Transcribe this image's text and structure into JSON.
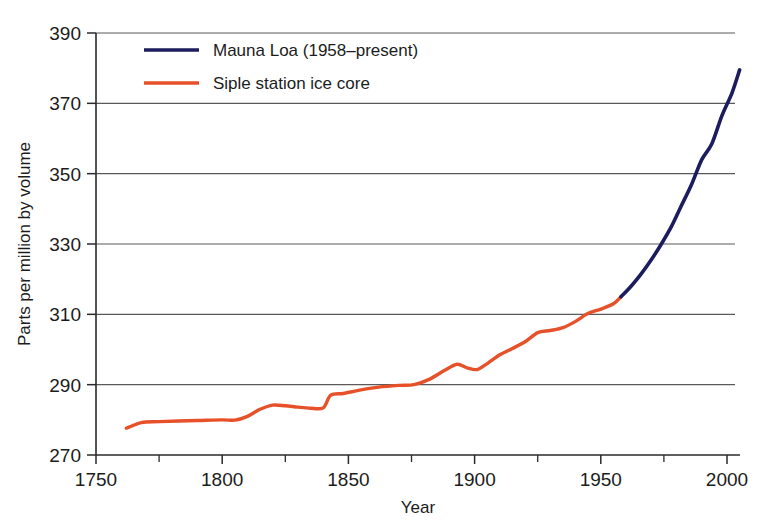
{
  "chart_data": {
    "type": "line",
    "title": "",
    "xlabel": "Year",
    "ylabel": "Parts per million by volume",
    "xlim": [
      1750,
      2005
    ],
    "ylim": [
      270,
      390
    ],
    "xticks": [
      1750,
      1800,
      1850,
      1900,
      1950,
      2000
    ],
    "xticklabels": [
      "1750",
      "1800",
      "1850",
      "1900",
      "1950",
      "2000"
    ],
    "xminorticks": [
      1775,
      1825,
      1875,
      1925,
      1975
    ],
    "yticks": [
      270,
      290,
      310,
      330,
      350,
      370,
      390
    ],
    "yticklabels": [
      "270",
      "290",
      "310",
      "330",
      "350",
      "370",
      "390"
    ],
    "grid": "horizontal",
    "legend_position": "top-left-inside",
    "series": [
      {
        "name": "Mauna Loa (1958–present)",
        "color": "#1c1c5e",
        "x": [
          1958,
          1962,
          1966,
          1970,
          1974,
          1978,
          1982,
          1986,
          1990,
          1994,
          1998,
          2002,
          2005
        ],
        "values": [
          315.0,
          318.0,
          321.5,
          325.5,
          330.0,
          335.0,
          341.0,
          347.0,
          354.0,
          358.5,
          366.5,
          373.0,
          379.5
        ]
      },
      {
        "name": "Siple station ice core",
        "color": "#e6512a",
        "x": [
          1762,
          1768,
          1775,
          1790,
          1800,
          1805,
          1810,
          1815,
          1820,
          1825,
          1830,
          1835,
          1840,
          1843,
          1848,
          1855,
          1862,
          1870,
          1876,
          1882,
          1888,
          1893,
          1897,
          1901,
          1905,
          1910,
          1915,
          1920,
          1925,
          1930,
          1935,
          1940,
          1945,
          1950,
          1955,
          1958
        ],
        "values": [
          277.6,
          279.2,
          279.5,
          279.8,
          280.0,
          279.9,
          281.0,
          283.0,
          284.2,
          284.0,
          283.6,
          283.3,
          283.4,
          287.0,
          287.5,
          288.5,
          289.3,
          289.8,
          290.0,
          291.5,
          294.0,
          295.8,
          294.8,
          294.3,
          296.0,
          298.5,
          300.3,
          302.2,
          304.8,
          305.4,
          306.2,
          308.0,
          310.3,
          311.5,
          313.0,
          315.0
        ]
      }
    ]
  },
  "legend": {
    "items": [
      {
        "label": "Mauna Loa (1958–present)",
        "color": "#1c1c5e"
      },
      {
        "label": "Siple station ice core",
        "color": "#e6512a"
      }
    ]
  },
  "axes": {
    "x_title": "Year",
    "y_title": "Parts per million by volume"
  }
}
